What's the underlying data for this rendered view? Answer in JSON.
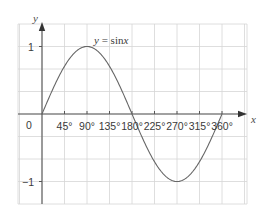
{
  "chart_data": {
    "type": "line",
    "title": "",
    "curve_label": "y = sinx",
    "curve_label_parts": {
      "y": "y",
      "eq": " = sin",
      "x": "x"
    },
    "xlabel": "x",
    "ylabel": "y",
    "origin_label": "0",
    "x_ticks": [
      0,
      45,
      90,
      135,
      180,
      225,
      270,
      315,
      360
    ],
    "x_tick_labels": [
      "45°",
      "90°",
      "135°",
      "180°",
      "225°",
      "270°",
      "315°",
      "360°"
    ],
    "y_ticks": [
      -1,
      1
    ],
    "y_tick_labels": [
      "1",
      "−1"
    ],
    "xlim": [
      -45,
      405
    ],
    "ylim": [
      -1.333,
      1.333
    ],
    "grid": true,
    "series": [
      {
        "name": "y = sinx",
        "x": [
          0,
          45,
          90,
          135,
          180,
          225,
          270,
          315,
          360
        ],
        "values": [
          0,
          0.707,
          1,
          0.707,
          0,
          -0.707,
          -1,
          -0.707,
          0
        ]
      }
    ]
  },
  "colors": {
    "grid": "#d6d6d6",
    "axis": "#555555",
    "curve": "#666666",
    "text": "#3a3a3a"
  }
}
